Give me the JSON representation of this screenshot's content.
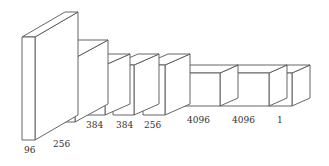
{
  "diagram": {
    "title": "",
    "type": "cnn-architecture-3d-blocks",
    "line_color": "#555555",
    "layers": [
      {
        "id": "conv1",
        "label": "96",
        "x": 22,
        "y": 37,
        "w": 13,
        "h": 103,
        "dx": 43,
        "dy": -25
      },
      {
        "id": "conv2",
        "label": "256",
        "x": 44,
        "y": 58,
        "w": 31,
        "h": 64,
        "dx": 33,
        "dy": -18
      },
      {
        "id": "conv3",
        "label": "384",
        "x": 83,
        "y": 65,
        "w": 22,
        "h": 50,
        "dx": 25,
        "dy": -11
      },
      {
        "id": "conv4",
        "label": "384",
        "x": 113,
        "y": 65,
        "w": 21,
        "h": 50,
        "dx": 25,
        "dy": -11
      },
      {
        "id": "conv5",
        "label": "256",
        "x": 143,
        "y": 65,
        "w": 22,
        "h": 50,
        "dx": 25,
        "dy": -11
      },
      {
        "id": "fc6",
        "label": "4096",
        "x": 172,
        "y": 73,
        "w": 48,
        "h": 33,
        "dx": 18,
        "dy": -8
      },
      {
        "id": "fc7",
        "label": "4096",
        "x": 220,
        "y": 73,
        "w": 49,
        "h": 33,
        "dx": 18,
        "dy": -8
      },
      {
        "id": "fc8",
        "label": "1",
        "x": 269,
        "y": 73,
        "w": 23,
        "h": 33,
        "dx": 18,
        "dy": -8
      }
    ],
    "labels": [
      {
        "text": "96",
        "x": 24,
        "y": 153
      },
      {
        "text": "256",
        "x": 53,
        "y": 147
      },
      {
        "text": "384",
        "x": 86,
        "y": 128
      },
      {
        "text": "384",
        "x": 116,
        "y": 128
      },
      {
        "text": "256",
        "x": 144,
        "y": 128
      },
      {
        "text": "4096",
        "x": 187,
        "y": 123
      },
      {
        "text": "4096",
        "x": 232,
        "y": 123
      },
      {
        "text": "1",
        "x": 277,
        "y": 123
      }
    ]
  }
}
